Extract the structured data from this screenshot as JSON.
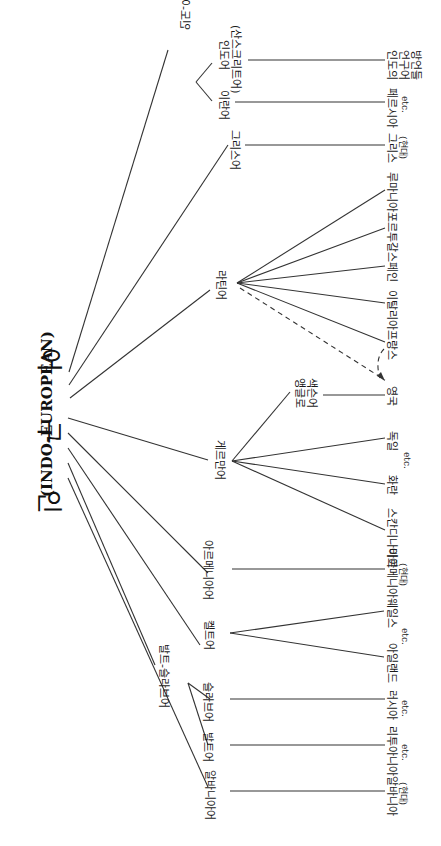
{
  "root": {
    "korean_chars": [
      "인",
      "구",
      "어"
    ],
    "english": "(INDO-EUROPEAN)"
  },
  "branches": {
    "indo_iranian": "인도-이란어",
    "indic": "인도어",
    "sanskrit": "(산스크리트어)",
    "iranian": "이란어",
    "greek": "그리스어",
    "latin": "라틴어",
    "germanic": "게르만어",
    "anglo_saxon_1": "앵글로",
    "anglo_saxon_2": "색슨어",
    "armenian": "아르메니아어",
    "celtic": "켈트어",
    "balto_slavic": "발트-슬라브어",
    "slavic": "슬라브어",
    "baltic": "발트어",
    "albanian": "알바니아어"
  },
  "leaves": {
    "indic_dialects_1": "인도의",
    "indic_dialects_2": "언구어",
    "indic_dialects_3": "방언들",
    "persian": "페르시아",
    "greek_modern": "그리스",
    "greek_modern_note": "(현대)",
    "romanian": "루마니아",
    "portuguese": "포르투갈",
    "spanish": "스페인",
    "italian": "이탈리아",
    "french": "프랑스",
    "english": "영국",
    "german": "독일",
    "dutch": "화란",
    "scandinavian": "스칸디나비아",
    "armenian_modern": "아르메니아",
    "armenian_modern_note": "(현대)",
    "welsh": "웨일스",
    "irish": "아일랜드",
    "russian": "러시아",
    "lithuanian": "리투아니아",
    "albanian_modern": "알바니아",
    "albanian_modern_note": "(현대)"
  },
  "notes": {
    "etc": "etc."
  }
}
